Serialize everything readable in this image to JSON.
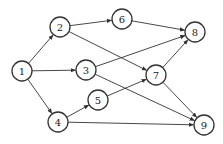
{
  "diagram": {
    "type": "directed-graph",
    "stroke_color": "#333333",
    "node_radius": 10,
    "nodes": [
      {
        "id": "1",
        "label": "1",
        "x": 22,
        "y": 71
      },
      {
        "id": "2",
        "label": "2",
        "x": 60,
        "y": 27
      },
      {
        "id": "3",
        "label": "3",
        "x": 86,
        "y": 70
      },
      {
        "id": "4",
        "label": "4",
        "x": 58,
        "y": 122
      },
      {
        "id": "5",
        "label": "5",
        "x": 98,
        "y": 100
      },
      {
        "id": "6",
        "label": "6",
        "x": 122,
        "y": 19
      },
      {
        "id": "7",
        "label": "7",
        "x": 156,
        "y": 75
      },
      {
        "id": "8",
        "label": "8",
        "x": 195,
        "y": 32
      },
      {
        "id": "9",
        "label": "9",
        "x": 204,
        "y": 125
      }
    ],
    "edges": [
      {
        "from": "1",
        "to": "2"
      },
      {
        "from": "1",
        "to": "3"
      },
      {
        "from": "1",
        "to": "4"
      },
      {
        "from": "2",
        "to": "6"
      },
      {
        "from": "2",
        "to": "7"
      },
      {
        "from": "3",
        "to": "8"
      },
      {
        "from": "3",
        "to": "9"
      },
      {
        "from": "4",
        "to": "5"
      },
      {
        "from": "4",
        "to": "9"
      },
      {
        "from": "5",
        "to": "7"
      },
      {
        "from": "6",
        "to": "8"
      },
      {
        "from": "7",
        "to": "8"
      },
      {
        "from": "7",
        "to": "9"
      }
    ]
  }
}
